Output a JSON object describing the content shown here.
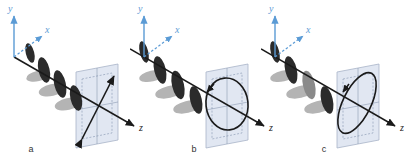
{
  "figure": {
    "type": "scientific-diagram",
    "background_color": "#ffffff"
  },
  "colors": {
    "axis_blue": "#5b9bd5",
    "axis_black": "#1a1a1a",
    "wave_dark": "#2b2b2b",
    "wave_light": "#b4b4b4",
    "wave_mid": "#8a8a8a",
    "plane_fill": "#dde4f0",
    "plane_stroke": "#a8b4c8",
    "plane_grid": "#7f8fa8",
    "caption_text": "#333333"
  },
  "panels": [
    {
      "id": "a",
      "caption": "a",
      "polarization": "linear",
      "projection_shape": "double-headed-diagonal-arrow",
      "axes": {
        "y": "y",
        "x": "x",
        "z": "z"
      }
    },
    {
      "id": "b",
      "caption": "b",
      "polarization": "circular",
      "projection_shape": "circle-with-rotation-arrow",
      "axes": {
        "y": "y",
        "x": "x",
        "z": "z"
      }
    },
    {
      "id": "c",
      "caption": "c",
      "polarization": "elliptical",
      "projection_shape": "tilted-ellipse-with-rotation-arrow",
      "axes": {
        "y": "y",
        "x": "x",
        "z": "z"
      }
    }
  ]
}
